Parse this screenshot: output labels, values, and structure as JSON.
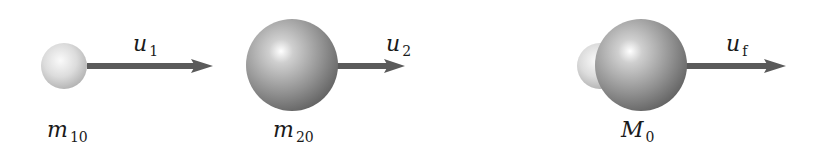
{
  "figure": {
    "colors": {
      "arrow": "#5a5a5a",
      "small_sphere_light": "#f4f4f4",
      "small_sphere_dark": "#b9b9b9",
      "large_sphere_light": "#ffffff",
      "large_sphere_dark": "#6d6d6d",
      "label": "#1a1a1a",
      "background": "#ffffff"
    },
    "objects": [
      {
        "id": "mass1",
        "mass_label": {
          "main": "m",
          "sub": "10"
        },
        "velocity_label": {
          "main": "u",
          "sub": "1"
        },
        "sphere": {
          "cx": 64,
          "cy": 66,
          "r": 23,
          "size": "small"
        },
        "arrow": {
          "x1": 87,
          "x2": 213,
          "y": 66
        }
      },
      {
        "id": "mass2",
        "mass_label": {
          "main": "m",
          "sub": "20"
        },
        "velocity_label": {
          "main": "u",
          "sub": "2"
        },
        "sphere": {
          "cx": 292,
          "cy": 65,
          "r": 46,
          "size": "large"
        },
        "arrow": {
          "x1": 339,
          "x2": 405,
          "y": 66
        }
      },
      {
        "id": "combined",
        "mass_label": {
          "main": "M",
          "sub": "0"
        },
        "velocity_label": {
          "main": "u",
          "sub": "f"
        },
        "spheres": [
          {
            "cx": 600,
            "cy": 66,
            "r": 23,
            "size": "small"
          },
          {
            "cx": 641,
            "cy": 65,
            "r": 46,
            "size": "large"
          }
        ],
        "arrow": {
          "x1": 687,
          "x2": 785,
          "y": 66
        }
      }
    ]
  }
}
